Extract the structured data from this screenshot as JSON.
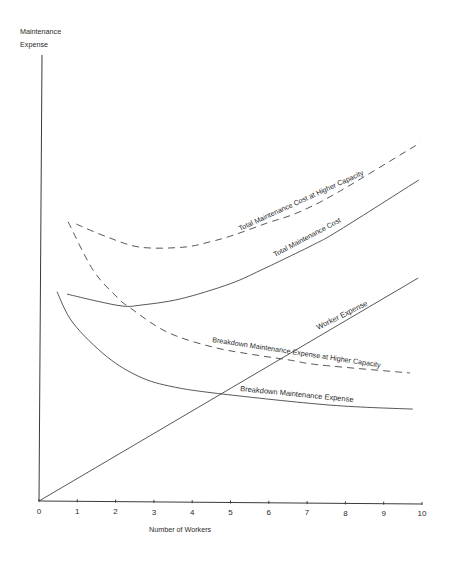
{
  "chart_data": {
    "type": "line",
    "title": "",
    "xlabel": "Number of Workers",
    "ylabel_lines": [
      "Maintenance",
      "Expense"
    ],
    "ylabel": "Maintenance Expense",
    "xlim": [
      0,
      10
    ],
    "ylim": [
      0,
      100
    ],
    "y_units_note": "no y tick values shown; y values are relative units (0 = x-axis, 100 = top of y-axis)",
    "xticks": [
      "0",
      "1",
      "2",
      "3",
      "4",
      "5",
      "6",
      "7",
      "8",
      "9",
      "10"
    ],
    "grid": false,
    "legend": "none (curves labeled inline)",
    "series": [
      {
        "name": "Worker Expense",
        "style": "solid",
        "points": [
          [
            0,
            0
          ],
          [
            9.9,
            50.0
          ]
        ]
      },
      {
        "name": "Total Maintenance Cost",
        "style": "solid",
        "points": [
          [
            0.73,
            46.4
          ],
          [
            1.52,
            44.8
          ],
          [
            2.19,
            43.7
          ],
          [
            2.64,
            43.9
          ],
          [
            3.68,
            45.3
          ],
          [
            4.99,
            48.7
          ],
          [
            5.85,
            52.0
          ],
          [
            6.29,
            53.8
          ],
          [
            7.15,
            57.4
          ],
          [
            7.86,
            60.8
          ],
          [
            9.92,
            72.0
          ]
        ]
      },
      {
        "name": "Total Maintenance Cost at Higher Capacity",
        "style": "dashed",
        "points": [
          [
            0.97,
            62.1
          ],
          [
            1.78,
            59.2
          ],
          [
            2.64,
            56.9
          ],
          [
            3.76,
            56.9
          ],
          [
            4.46,
            58.1
          ],
          [
            5.07,
            59.6
          ],
          [
            5.95,
            62.3
          ],
          [
            6.74,
            64.6
          ],
          [
            7.78,
            69.1
          ],
          [
            9.95,
            80.3
          ]
        ]
      },
      {
        "name": "Breakdown Maintenance Expense",
        "style": "solid",
        "points": [
          [
            0.47,
            46.9
          ],
          [
            0.89,
            39.9
          ],
          [
            1.78,
            32.3
          ],
          [
            2.64,
            27.8
          ],
          [
            3.5,
            25.6
          ],
          [
            4.78,
            24.0
          ],
          [
            7.6,
            21.5
          ],
          [
            9.76,
            20.6
          ]
        ]
      },
      {
        "name": "Breakdown Maintenance Expense at Higher Capacity",
        "style": "dashed",
        "points": [
          [
            0.76,
            62.6
          ],
          [
            1.41,
            51.8
          ],
          [
            2.04,
            45.7
          ],
          [
            2.38,
            43.3
          ],
          [
            3.34,
            37.9
          ],
          [
            4.54,
            34.5
          ],
          [
            5.69,
            32.7
          ],
          [
            6.55,
            31.6
          ],
          [
            7.34,
            30.5
          ],
          [
            9.69,
            28.7
          ]
        ]
      }
    ],
    "annotations": [
      {
        "text": "Total Maintenance Cost at Higher Capacity"
      },
      {
        "text": "Total Maintenance Cost"
      },
      {
        "text": "Worker Expense"
      },
      {
        "text": "Breakdown Maintenance Expense at Higher Capacity"
      },
      {
        "text": "Breakdown Maintenance Expense"
      }
    ]
  }
}
